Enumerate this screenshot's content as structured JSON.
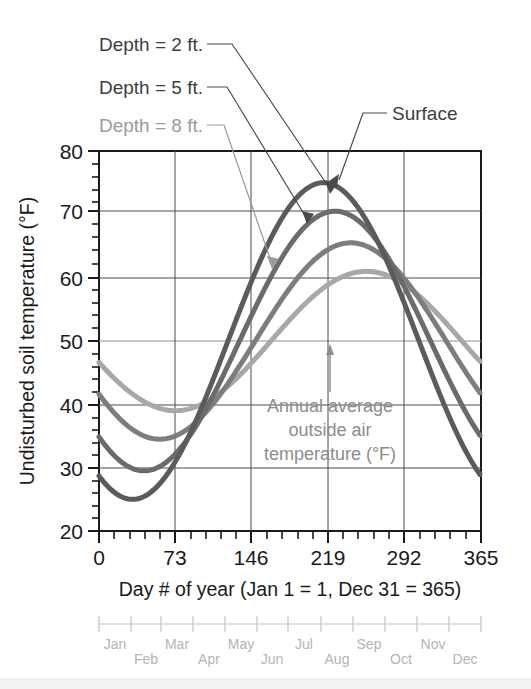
{
  "chart_data": {
    "type": "line",
    "title": "",
    "xlabel": "Day # of year (Jan 1 = 1, Dec 31 = 365)",
    "ylabel": "Undisturbed soil temperature (°F)",
    "xlim": [
      0,
      365
    ],
    "ylim": [
      20,
      80
    ],
    "x_ticks": [
      "0",
      "73",
      "146",
      "219",
      "292",
      "365"
    ],
    "x_tick_values": [
      0,
      73,
      146,
      219,
      292,
      365
    ],
    "x_minor_step": 14.6,
    "y_ticks": [
      "20",
      "30",
      "40",
      "50",
      "60",
      "70",
      "80"
    ],
    "y_tick_values": [
      20,
      30,
      40,
      50,
      60,
      70,
      80
    ],
    "y_minor_step": 2,
    "grid": true,
    "legend": "callouts",
    "annual_average_line": 50,
    "series": [
      {
        "name": "Surface",
        "color": "#5b5b5b",
        "mean": 50,
        "amplitude": 25,
        "phase_day": 32,
        "min": 25,
        "min_day": 32,
        "max": 75,
        "max_day": 214,
        "value_day0": 30,
        "value_day365": 30
      },
      {
        "name": "Depth = 2 ft.",
        "color": "#6b6b6b",
        "mean": 50,
        "amplitude": 20.5,
        "phase_day": 43,
        "min": 29.5,
        "min_day": 43,
        "max": 70.5,
        "max_day": 225,
        "value_day0": 36,
        "value_day365": 36.5
      },
      {
        "name": "Depth = 5 ft.",
        "color": "#7d7d7d",
        "mean": 50,
        "amplitude": 15.5,
        "phase_day": 58,
        "min": 34.5,
        "min_day": 58,
        "max": 65.5,
        "max_day": 240,
        "value_day0": 42.5,
        "value_day365": 43
      },
      {
        "name": "Depth = 8 ft.",
        "color": "#a8a8a8",
        "mean": 50,
        "amplitude": 11,
        "phase_day": 73,
        "min": 39,
        "min_day": 73,
        "max": 61,
        "max_day": 255,
        "value_day0": 47.8,
        "value_day365": 48.5
      }
    ],
    "annotations": [
      {
        "name": "surface",
        "text": "Surface",
        "target_day": 214,
        "target_temp": 75
      },
      {
        "name": "depth-2ft",
        "text": "Depth = 2 ft.",
        "target_day": 210,
        "target_temp": 70
      },
      {
        "name": "depth-5ft",
        "text": "Depth = 5 ft.",
        "target_day": 192,
        "target_temp": 62
      },
      {
        "name": "depth-8ft",
        "text": "Depth = 8 ft.",
        "target_day": 178,
        "target_temp": 54
      },
      {
        "name": "annual-average",
        "text": "Annual average outside air temperature (°F)",
        "target_day": 228,
        "target_temp": 50
      }
    ],
    "annual_average_label_lines": [
      "Annual average",
      "outside air",
      "temperature (°F)"
    ],
    "month_axis": {
      "labels": [
        "Jan",
        "Feb",
        "Mar",
        "Apr",
        "May",
        "Jun",
        "Jul",
        "Aug",
        "Sep",
        "Oct",
        "Nov",
        "Dec"
      ],
      "boundaries_day": [
        0,
        31,
        59,
        90,
        120,
        151,
        181,
        212,
        243,
        273,
        304,
        334,
        365
      ]
    }
  },
  "callouts": {
    "depth2": "Depth = 2 ft.",
    "depth5": "Depth = 5 ft.",
    "depth8": "Depth = 8 ft.",
    "surface": "Surface"
  },
  "annual_average": {
    "line1": "Annual average",
    "line2": "outside air",
    "line3": "temperature (°F)"
  },
  "axes": {
    "y_title": "Undisturbed soil temperature (°F)",
    "x_title": "Day # of year (Jan 1 = 1, Dec 31 = 365)",
    "y0": "20",
    "y1": "30",
    "y2": "40",
    "y3": "50",
    "y4": "60",
    "y5": "70",
    "y6": "80",
    "x0": "0",
    "x1": "73",
    "x2": "146",
    "x3": "219",
    "x4": "292",
    "x5": "365"
  },
  "months": {
    "m0": "Jan",
    "m1": "Feb",
    "m2": "Mar",
    "m3": "Apr",
    "m4": "May",
    "m5": "Jun",
    "m6": "Jul",
    "m7": "Aug",
    "m8": "Sep",
    "m9": "Oct",
    "m10": "Nov",
    "m11": "Dec"
  }
}
